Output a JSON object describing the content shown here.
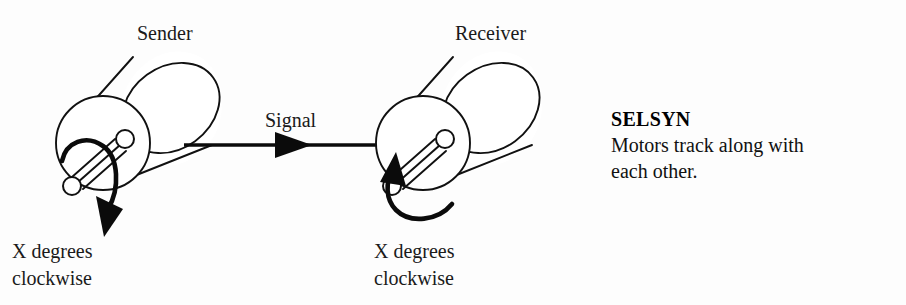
{
  "diagram": {
    "background_color": "#fdfdfd",
    "ink_color": "#111111",
    "sender": {
      "label": "Sender",
      "rotation_caption_line1": "X degrees",
      "rotation_caption_line2": "clockwise",
      "rotation_direction": "clockwise",
      "shaft_icon": "shaft-pointer-icon",
      "arrow_icon": "curved-rotation-arrow-icon"
    },
    "receiver": {
      "label": "Receiver",
      "rotation_caption_line1": "X degrees",
      "rotation_caption_line2": "clockwise",
      "rotation_direction": "clockwise",
      "shaft_icon": "shaft-pointer-icon",
      "arrow_icon": "curved-rotation-arrow-icon"
    },
    "signal": {
      "label": "Signal",
      "direction": "sender-to-receiver",
      "arrow_icon": "right-arrow-icon"
    },
    "caption": {
      "title": "SELSYN",
      "line1": "Motors track along with",
      "line2": "each other."
    }
  }
}
